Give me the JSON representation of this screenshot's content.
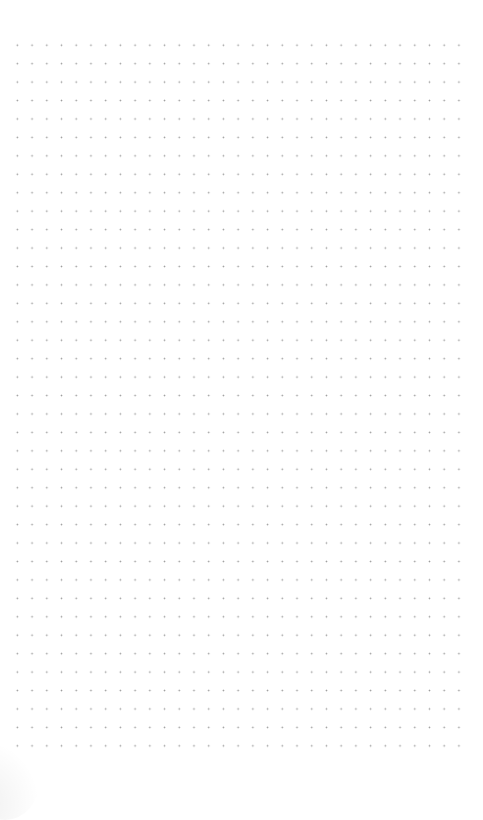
{
  "page": {
    "type": "dot-grid-canvas",
    "background_color": "#ffffff",
    "dot_color": "#9a9a9a",
    "grid": {
      "columns": 31,
      "rows": 39,
      "origin_x": 17,
      "origin_y": 45,
      "spacing_x": 14.73,
      "spacing_y": 18.45
    }
  }
}
